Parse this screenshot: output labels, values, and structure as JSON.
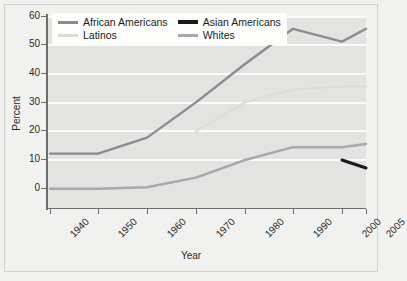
{
  "chart_data": {
    "type": "line",
    "title": "",
    "xlabel": "Year",
    "ylabel": "Percent",
    "x": [
      1940,
      1950,
      1960,
      1970,
      1980,
      1990,
      2000,
      2005
    ],
    "xtick_labels": [
      "1940",
      "1950",
      "1960",
      "1970",
      "1980",
      "1990",
      "2000",
      "2005"
    ],
    "ytick_labels": [
      "0",
      "10",
      "20",
      "30",
      "40",
      "50",
      "60"
    ],
    "ylim": [
      0,
      60
    ],
    "ytick_step": 10,
    "grid": "horizontal",
    "legend_position": "top-left",
    "series": [
      {
        "name": "African Americans",
        "color": "#8c8c8c",
        "x": [
          1940,
          1950,
          1960,
          1970,
          1980,
          1990,
          2000,
          2005
        ],
        "values": [
          17,
          17,
          22,
          33,
          45,
          56,
          52,
          56
        ]
      },
      {
        "name": "Asian Americans",
        "color": "#1a1a1a",
        "x": [
          2000,
          2005
        ],
        "values": [
          15,
          12.5
        ]
      },
      {
        "name": "Latinos",
        "color": "#dcdcda",
        "x": [
          1970,
          1980,
          1990,
          2000,
          2005
        ],
        "values": [
          24,
          33,
          37,
          38,
          38
        ]
      },
      {
        "name": "Whites",
        "color": "#a8a8a8",
        "x": [
          1940,
          1950,
          1960,
          1970,
          1980,
          1990,
          2000,
          2005
        ],
        "values": [
          6,
          6,
          6.5,
          9.5,
          15,
          19,
          19,
          20
        ]
      }
    ]
  },
  "legend": {
    "items": [
      {
        "label": "African Americans",
        "color": "#8c8c8c",
        "thickness": 3
      },
      {
        "label": "Asian Americans",
        "color": "#1a1a1a",
        "thickness": 4
      },
      {
        "label": "Latinos",
        "color": "#dcdcda",
        "thickness": 3
      },
      {
        "label": "Whites",
        "color": "#a8a8a8",
        "thickness": 3
      }
    ]
  },
  "axes": {
    "y_title": "Percent",
    "x_title": "Year",
    "y_labels": [
      "60",
      "50",
      "40",
      "30",
      "20",
      "10",
      "0"
    ],
    "x_labels": [
      "1940",
      "1950",
      "1960",
      "1970",
      "1980",
      "1990",
      "2000",
      "2005"
    ]
  },
  "colors": {
    "plot_background": "#e3e3e1",
    "page_background": "#f1f1ef",
    "gridline": "#fbfbfa",
    "axis": "#6d6d6d",
    "text": "#2b2b2b"
  }
}
